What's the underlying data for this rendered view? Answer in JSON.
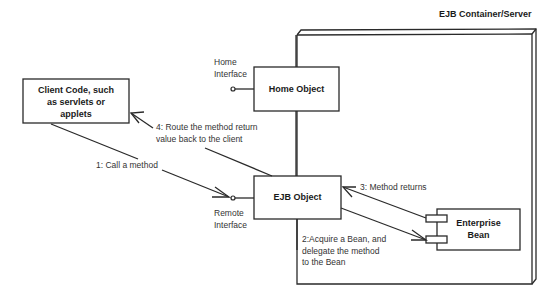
{
  "diagram": {
    "container": {
      "label": "EJB Container/Server"
    },
    "nodes": {
      "client": {
        "label_lines": [
          "Client Code, such",
          "as servlets or",
          "applets"
        ]
      },
      "home_object": {
        "label": "Home Object"
      },
      "ejb_object": {
        "label": "EJB Object"
      },
      "enterprise_bean": {
        "label_lines": [
          "Enterprise",
          "Bean"
        ]
      }
    },
    "interfaces": {
      "home": {
        "label_lines": [
          "Home",
          "Interface"
        ]
      },
      "remote": {
        "label_lines": [
          "Remote",
          "Interface"
        ]
      }
    },
    "messages": [
      {
        "step": 1,
        "label_lines": [
          "1: Call a method"
        ]
      },
      {
        "step": 2,
        "label_lines": [
          "2:Acquire a Bean, and",
          "delegate the method",
          "to the Bean"
        ]
      },
      {
        "step": 3,
        "label_lines": [
          "3: Method returns"
        ]
      },
      {
        "step": 4,
        "label_lines": [
          "4: Route the method return",
          "value back to the client"
        ]
      }
    ],
    "colors": {
      "line": "#2a2a2a",
      "background": "#ffffff"
    }
  }
}
